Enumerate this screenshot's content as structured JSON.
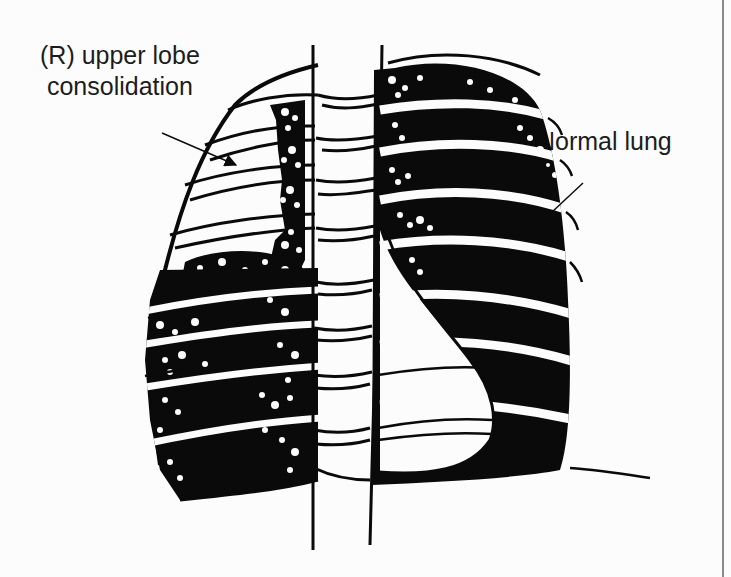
{
  "figure": {
    "type": "schematic chest x-ray illustration",
    "labels": {
      "consolidation_line1": "(R) upper lobe",
      "consolidation_line2": "consolidation",
      "normal": "Normal lung"
    },
    "annotations": [
      {
        "id": "consolidation-arrow",
        "label": "(R) upper lobe consolidation",
        "from": [
          162,
          133
        ],
        "to": [
          236,
          165
        ]
      },
      {
        "id": "normal-lung-arrow",
        "label": "Normal lung",
        "from": [
          583,
          183
        ],
        "to": [
          535,
          228
        ]
      }
    ],
    "colors": {
      "background": "#fcfcfc",
      "ink": "#0a0a0a",
      "frame_line": "#8a8a8a"
    }
  }
}
